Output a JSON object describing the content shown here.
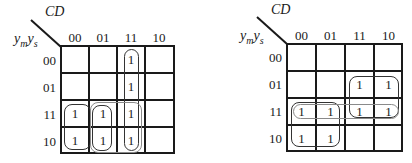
{
  "maps": [
    {
      "id": "map-1",
      "col_var": "CD",
      "row_var_main": "y",
      "row_var_sub1": "m",
      "row_var_main2": "y",
      "row_var_sub2": "s",
      "col_labels": [
        "00",
        "01",
        "11",
        "10"
      ],
      "row_labels": [
        "00",
        "01",
        "11",
        "10"
      ],
      "cells": [
        [
          "",
          "",
          "1",
          ""
        ],
        [
          "",
          "",
          "1",
          ""
        ],
        [
          "1",
          "1",
          "1",
          ""
        ],
        [
          "1",
          "1",
          "1",
          ""
        ]
      ],
      "groups": [
        {
          "name": "column-11-group",
          "rows": [
            0,
            3
          ],
          "cols": [
            2,
            2
          ]
        },
        {
          "name": "cols-00-01-rows-11-10-group",
          "rows": [
            2,
            3
          ],
          "cols": [
            0,
            0
          ]
        },
        {
          "name": "col-01-rows-11-10-group",
          "rows": [
            2,
            3
          ],
          "cols": [
            1,
            1
          ]
        },
        {
          "name": "cols-01-11-rows-11-10-group",
          "rows": [
            2,
            3
          ],
          "cols": [
            1,
            2
          ]
        }
      ]
    },
    {
      "id": "map-2",
      "col_var": "CD",
      "row_var_main": "y",
      "row_var_sub1": "m",
      "row_var_main2": "y",
      "row_var_sub2": "s",
      "col_labels": [
        "00",
        "01",
        "11",
        "10"
      ],
      "row_labels": [
        "00",
        "01",
        "11",
        "10"
      ],
      "cells": [
        [
          "",
          "",
          "",
          ""
        ],
        [
          "",
          "",
          "1",
          "1"
        ],
        [
          "1",
          "1",
          "1",
          "1"
        ],
        [
          "1",
          "1",
          "",
          ""
        ]
      ],
      "groups": [
        {
          "name": "cols-11-10-rows-01-11-group",
          "rows": [
            1,
            2
          ],
          "cols": [
            2,
            3
          ]
        },
        {
          "name": "cols-00-01-rows-11-10-group",
          "rows": [
            2,
            3
          ],
          "cols": [
            0,
            1
          ]
        },
        {
          "name": "row-11-group",
          "rows": [
            2,
            2
          ],
          "cols": [
            0,
            3
          ]
        }
      ]
    }
  ]
}
